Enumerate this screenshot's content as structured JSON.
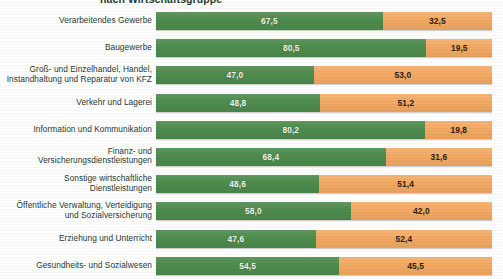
{
  "subtitle": "nach Wirtschaftsgruppe",
  "colors": {
    "green": "#4e8c4d",
    "orange": "#f3a963",
    "label_text": "#243b34",
    "background": "#fefefe"
  },
  "chart_data": {
    "type": "bar",
    "orientation": "horizontal",
    "stacked": true,
    "stack_total": 100,
    "title": "nach Wirtschaftsgruppe",
    "xlabel": "",
    "ylabel": "",
    "xlim": [
      0,
      100
    ],
    "grid": false,
    "legend_position": "none",
    "decimal_separator": ",",
    "categories": [
      "Verarbeitendes Gewerbe",
      "Baugewerbe",
      "Groß- und Einzelhandel, Handel,\nInstandhaltung und Reparatur von KFZ",
      "Verkehr und Lagerei",
      "Information und Kommunikation",
      "Finanz- und\nVersicherungsdienstleistungen",
      "Sonstige wirtschaftliche\nDienstleistungen",
      "Öffentliche Verwaltung, Verteidigung\nund Sozialversicherung",
      "Erziehung und Unterricht",
      "Gesundheits- und Sozialwesen"
    ],
    "series": [
      {
        "name": "Anteil gruen",
        "color": "#4e8c4d",
        "values": [
          67.5,
          80.5,
          47.0,
          48.8,
          80.2,
          68.4,
          48.6,
          58.0,
          47.6,
          54.5
        ],
        "labels": [
          "67,5",
          "80,5",
          "47,0",
          "48,8",
          "80,2",
          "68,4",
          "48,6",
          "58,0",
          "47,6",
          "54,5"
        ]
      },
      {
        "name": "Anteil orange",
        "color": "#f3a963",
        "values": [
          32.5,
          19.5,
          53.0,
          51.2,
          19.8,
          31.6,
          51.4,
          42.0,
          52.4,
          45.5
        ],
        "labels": [
          "32,5",
          "19,5",
          "53,0",
          "51,2",
          "19,8",
          "31,6",
          "51,4",
          "42,0",
          "52,4",
          "45,5"
        ]
      }
    ]
  }
}
